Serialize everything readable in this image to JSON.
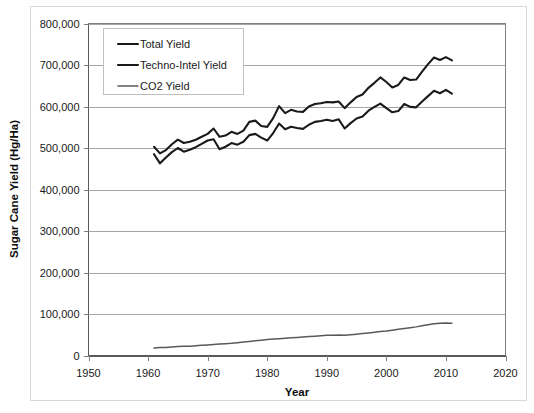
{
  "chart_data": {
    "type": "line",
    "title": "",
    "xlabel": "Year",
    "ylabel": "Sugar Cane Yield (Hg/Ha)",
    "xlim": [
      1950,
      2020
    ],
    "ylim": [
      0,
      800000
    ],
    "xticks": [
      1950,
      1960,
      1970,
      1980,
      1990,
      2000,
      2010,
      2020
    ],
    "xtick_labels": [
      "1950",
      "1960",
      "1970",
      "1980",
      "1990",
      "2000",
      "2010",
      "2020"
    ],
    "yticks": [
      0,
      100000,
      200000,
      300000,
      400000,
      500000,
      600000,
      700000,
      800000
    ],
    "ytick_labels": [
      "0",
      "100,000",
      "200,000",
      "300,000",
      "400,000",
      "500,000",
      "600,000",
      "700,000",
      "800,000"
    ],
    "grid": true,
    "grid_axis": "y",
    "legend_position": "upper left inside plot",
    "x": [
      1961,
      1962,
      1963,
      1964,
      1965,
      1966,
      1967,
      1968,
      1969,
      1970,
      1971,
      1972,
      1973,
      1974,
      1975,
      1976,
      1977,
      1978,
      1979,
      1980,
      1981,
      1982,
      1983,
      1984,
      1985,
      1986,
      1987,
      1988,
      1989,
      1990,
      1991,
      1992,
      1993,
      1994,
      1995,
      1996,
      1997,
      1998,
      1999,
      2000,
      2001,
      2002,
      2003,
      2004,
      2005,
      2006,
      2007,
      2008,
      2009,
      2010,
      2011
    ],
    "series": [
      {
        "name": "Total Yield",
        "color": "#1a1a1a",
        "width": 2.1,
        "values": [
          503000,
          487000,
          495000,
          509000,
          520000,
          512000,
          515000,
          520000,
          527000,
          534000,
          547000,
          527000,
          530000,
          539000,
          534000,
          542000,
          563000,
          566000,
          553000,
          551000,
          572000,
          601000,
          584000,
          592000,
          588000,
          587000,
          600000,
          606000,
          608000,
          611000,
          610000,
          612000,
          596000,
          610000,
          623000,
          629000,
          645000,
          657000,
          670000,
          659000,
          646000,
          652000,
          670000,
          664000,
          665000,
          684000,
          702000,
          718000,
          712000,
          719000,
          711000
        ]
      },
      {
        "name": "Techno-Intel Yield",
        "color": "#1a1a1a",
        "width": 2.1,
        "values": [
          485000,
          463000,
          477000,
          490000,
          500000,
          491000,
          496000,
          502000,
          510000,
          518000,
          521000,
          497000,
          503000,
          512000,
          508000,
          515000,
          531000,
          534000,
          525000,
          518000,
          536000,
          559000,
          545000,
          551000,
          548000,
          546000,
          556000,
          563000,
          565000,
          568000,
          565000,
          569000,
          547000,
          560000,
          571000,
          576000,
          590000,
          599000,
          607000,
          596000,
          586000,
          589000,
          606000,
          599000,
          598000,
          612000,
          625000,
          638000,
          632000,
          640000,
          631000
        ]
      },
      {
        "name": "CO2 Yield",
        "color": "#595959",
        "width": 1.5,
        "values": [
          18000,
          19000,
          19500,
          20500,
          21500,
          22000,
          22500,
          23500,
          24500,
          25500,
          26500,
          27500,
          28500,
          29500,
          31000,
          32500,
          34000,
          35500,
          37000,
          38500,
          39500,
          40500,
          41500,
          42500,
          43500,
          44500,
          45500,
          46500,
          47500,
          48500,
          49000,
          49500,
          48500,
          50000,
          51500,
          53000,
          54500,
          56000,
          58000,
          59000,
          61000,
          63000,
          65000,
          67000,
          69000,
          71500,
          74000,
          76500,
          77500,
          78500,
          78000
        ]
      }
    ]
  },
  "legend": {
    "items": [
      {
        "label": "Total Yield"
      },
      {
        "label": "Techno-Intel Yield"
      },
      {
        "label": "CO2 Yield"
      }
    ]
  }
}
